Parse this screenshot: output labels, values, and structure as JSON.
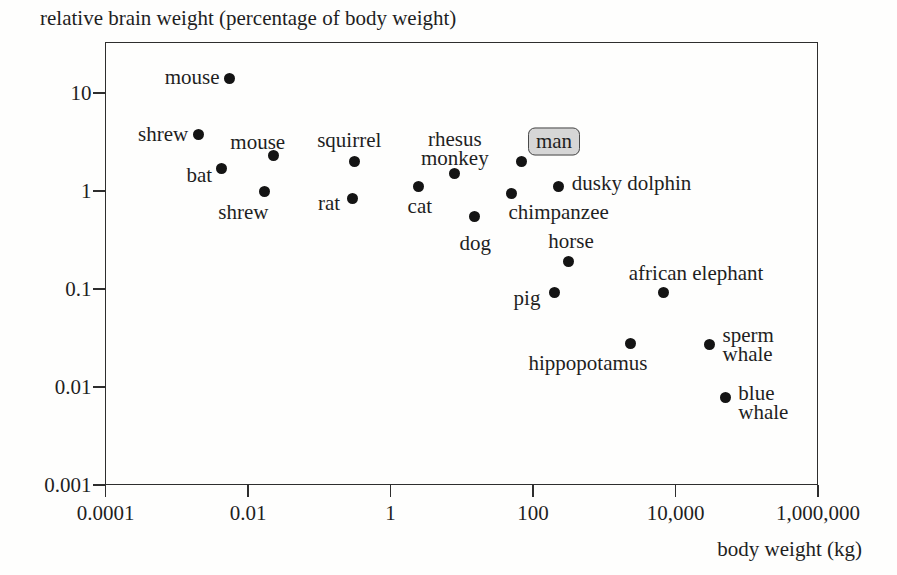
{
  "title": "relative brain weight (percentage of body weight)",
  "colors": {
    "background": "#fefefd",
    "axis": "#2e2e2e",
    "text": "#1f1f1f",
    "dot": "#141414",
    "man_box_fill": "#d6d6d6",
    "man_box_border": "#4a4a4a"
  },
  "chart_data": {
    "type": "scatter",
    "title": "relative brain weight (percentage of body weight)",
    "xlabel": "body weight (kg)",
    "ylabel": "relative brain weight (percentage of body weight)",
    "x_scale": "log",
    "y_scale": "log",
    "xlim": [
      0.0001,
      1000000
    ],
    "ylim": [
      0.001,
      33
    ],
    "grid": false,
    "x_ticks": [
      {
        "value": 0.0001,
        "label": "0.0001"
      },
      {
        "value": 0.01,
        "label": "0.01"
      },
      {
        "value": 1,
        "label": "1"
      },
      {
        "value": 100,
        "label": "100"
      },
      {
        "value": 10000,
        "label": "10,000"
      },
      {
        "value": 1000000,
        "label": "1,000,000"
      }
    ],
    "y_ticks": [
      {
        "value": 10,
        "label": "10"
      },
      {
        "value": 1,
        "label": "1"
      },
      {
        "value": 0.1,
        "label": "0.1"
      },
      {
        "value": 0.01,
        "label": "0.01"
      },
      {
        "value": 0.001,
        "label": "0.001"
      }
    ],
    "points": [
      {
        "name": "mouse-high",
        "label": "mouse",
        "x_kg": 0.0055,
        "brain_pct": 14,
        "align": "right",
        "dx": -10,
        "dy": -2,
        "boxed": false
      },
      {
        "name": "shrew-high",
        "label": "shrew",
        "x_kg": 0.002,
        "brain_pct": 3.8,
        "align": "right",
        "dx": -10,
        "dy": 0,
        "boxed": false
      },
      {
        "name": "mouse-low",
        "label": "mouse",
        "x_kg": 0.023,
        "brain_pct": 2.3,
        "align": "center",
        "dx": -16,
        "dy": -14,
        "boxed": false
      },
      {
        "name": "bat",
        "label": "bat",
        "x_kg": 0.0042,
        "brain_pct": 1.7,
        "align": "right",
        "dx": -9,
        "dy": 7,
        "boxed": false
      },
      {
        "name": "shrew-low",
        "label": "shrew",
        "x_kg": 0.017,
        "brain_pct": 1.0,
        "align": "center",
        "dx": -21,
        "dy": 21,
        "boxed": false
      },
      {
        "name": "squirrel",
        "label": "squirrel",
        "x_kg": 0.31,
        "brain_pct": 2.0,
        "align": "center",
        "dx": -5,
        "dy": -21,
        "boxed": false
      },
      {
        "name": "rat",
        "label": "rat",
        "x_kg": 0.29,
        "brain_pct": 0.84,
        "align": "right",
        "dx": -12,
        "dy": 5,
        "boxed": false
      },
      {
        "name": "cat",
        "label": "cat",
        "x_kg": 2.5,
        "brain_pct": 1.1,
        "align": "center",
        "dx": 1,
        "dy": 19,
        "boxed": false
      },
      {
        "name": "rhesus-monkey",
        "label": "rhesus\nmonkey",
        "x_kg": 8,
        "brain_pct": 1.5,
        "align": "center",
        "dx": 0,
        "dy": -25,
        "boxed": false
      },
      {
        "name": "dog",
        "label": "dog",
        "x_kg": 15,
        "brain_pct": 0.55,
        "align": "center",
        "dx": 1,
        "dy": 27,
        "boxed": false
      },
      {
        "name": "chimpanzee",
        "label": "chimpanzee",
        "x_kg": 50,
        "brain_pct": 0.94,
        "align": "left",
        "dx": -3,
        "dy": 18,
        "boxed": false
      },
      {
        "name": "man",
        "label": "man",
        "x_kg": 70,
        "brain_pct": 2.0,
        "align": "left",
        "dx": 6,
        "dy": -20,
        "boxed": true
      },
      {
        "name": "dusky-dolphin",
        "label": "dusky dolphin",
        "x_kg": 230,
        "brain_pct": 1.1,
        "align": "left",
        "dx": 13,
        "dy": -4,
        "boxed": false
      },
      {
        "name": "horse",
        "label": "horse",
        "x_kg": 320,
        "brain_pct": 0.19,
        "align": "center",
        "dx": 2,
        "dy": -21,
        "boxed": false
      },
      {
        "name": "pig",
        "label": "pig",
        "x_kg": 200,
        "brain_pct": 0.093,
        "align": "right",
        "dx": -14,
        "dy": 6,
        "boxed": false
      },
      {
        "name": "african-elephant",
        "label": "african elephant",
        "x_kg": 6700,
        "brain_pct": 0.093,
        "align": "center",
        "dx": 33,
        "dy": -19,
        "boxed": false
      },
      {
        "name": "hippopotamus",
        "label": "hippopotamus",
        "x_kg": 2300,
        "brain_pct": 0.028,
        "align": "center",
        "dx": -42,
        "dy": 20,
        "boxed": false
      },
      {
        "name": "sperm-whale",
        "label": "sperm\nwhale",
        "x_kg": 30000,
        "brain_pct": 0.027,
        "align": "left",
        "dx": 13,
        "dy": 0,
        "boxed": false
      },
      {
        "name": "blue-whale",
        "label": "blue\nwhale",
        "x_kg": 50000,
        "brain_pct": 0.0078,
        "align": "left",
        "dx": 13,
        "dy": 5,
        "boxed": false
      }
    ]
  }
}
